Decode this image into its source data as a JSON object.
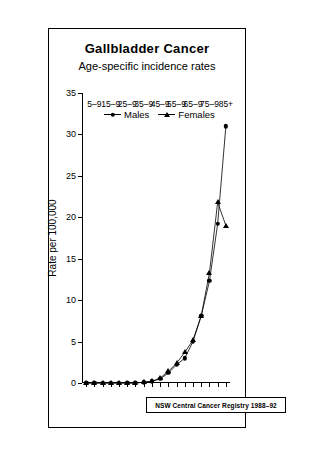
{
  "chart_data": {
    "type": "line",
    "title": "Gallbladder Cancer",
    "subtitle": "Age-specific incidence rates",
    "xlabel": "",
    "ylabel": "Rate per 100,000",
    "ylim": [
      0,
      35
    ],
    "yticks": [
      0,
      5,
      10,
      15,
      20,
      25,
      30,
      35
    ],
    "grid": false,
    "legend_position": "top-left",
    "source": "NSW Central Cancer Registry 1988–92",
    "categories": [
      "0-4",
      "5-9",
      "10-14",
      "15-9",
      "20-24",
      "25-9",
      "30-34",
      "35-9",
      "40-44",
      "45-9",
      "50-54",
      "55-9",
      "60-64",
      "65-9",
      "70-74",
      "75-9",
      "80-84",
      "85+"
    ],
    "xtick_labels": [
      "",
      "5–9",
      "",
      "15–9",
      "",
      "25–9",
      "",
      "35–9",
      "",
      "45–9",
      "",
      "55–9",
      "",
      "65–9",
      "",
      "75–9",
      "",
      "85+"
    ],
    "series": [
      {
        "name": "Males",
        "marker": "circle",
        "values": [
          0,
          0,
          0,
          0,
          0,
          0,
          0,
          0.1,
          0.2,
          0.5,
          1.2,
          2.2,
          3.0,
          5.0,
          8.1,
          12.3,
          19.2,
          31.0
        ]
      },
      {
        "name": "Females",
        "marker": "triangle",
        "values": [
          0,
          0,
          0,
          0,
          0,
          0,
          0,
          0.1,
          0.2,
          0.6,
          1.4,
          2.4,
          3.7,
          5.2,
          8.1,
          13.3,
          21.8,
          19.0
        ]
      }
    ]
  },
  "legend": {
    "males_label": "Males",
    "females_label": "Females"
  },
  "footer": {
    "text": "NSW Central Cancer Registry 1988–92"
  }
}
